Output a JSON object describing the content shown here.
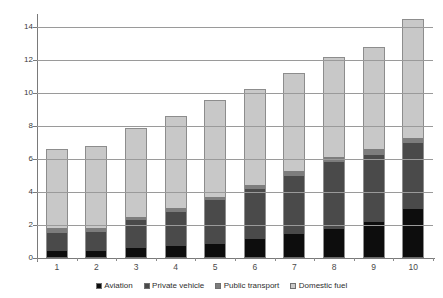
{
  "chart_data": {
    "type": "bar",
    "subtype": "stacked-vertical",
    "title": "",
    "xlabel": "",
    "ylabel": "",
    "categories": [
      "1",
      "2",
      "3",
      "4",
      "5",
      "6",
      "7",
      "8",
      "9",
      "10"
    ],
    "ylim": [
      0,
      14.8
    ],
    "yticks": [
      0,
      2,
      4,
      6,
      8,
      10,
      12,
      14
    ],
    "ytick_labels": [
      "0",
      "2",
      "4",
      "6",
      "8",
      "10",
      "12",
      "14"
    ],
    "grid": "horizontal",
    "legend_position": "bottom",
    "series": [
      {
        "name": "Aviation",
        "color": "#0d0d0d",
        "values": [
          0.45,
          0.4,
          0.6,
          0.75,
          0.85,
          1.15,
          1.45,
          1.75,
          2.2,
          3.0
        ]
      },
      {
        "name": "Private vehicle",
        "color": "#4a4a4a",
        "values": [
          1.05,
          1.2,
          1.7,
          2.05,
          2.65,
          3.05,
          3.55,
          4.1,
          4.05,
          4.0
        ]
      },
      {
        "name": "Public transport",
        "color": "#7d7d7d",
        "values": [
          0.3,
          0.2,
          0.2,
          0.25,
          0.2,
          0.25,
          0.3,
          0.25,
          0.35,
          0.3
        ]
      },
      {
        "name": "Domestic fuel",
        "color": "#c8c8c8",
        "values": [
          4.8,
          5.0,
          5.4,
          5.55,
          5.9,
          5.8,
          5.95,
          6.1,
          6.2,
          7.2
        ]
      }
    ],
    "totals": [
      6.6,
      6.8,
      7.9,
      8.6,
      9.6,
      10.25,
      11.25,
      12.2,
      12.8,
      14.5
    ]
  }
}
